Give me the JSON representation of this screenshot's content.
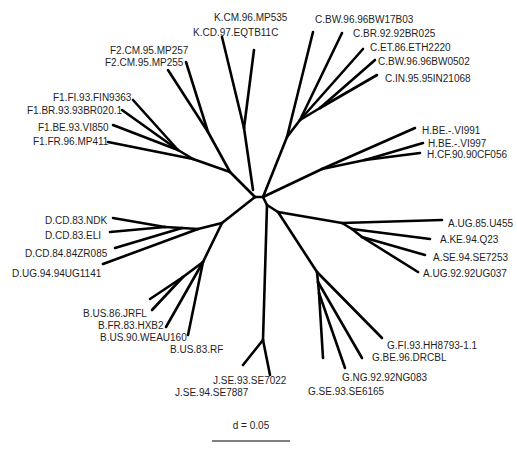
{
  "tree": {
    "type": "unrooted-phylogenetic-tree",
    "line_color": "#000000",
    "subtypes": [
      {
        "name": "K",
        "leaves": [
          {
            "label": "K.CM.96.MP535"
          },
          {
            "label": "K.CD.97.EQTB11C"
          }
        ]
      },
      {
        "name": "C",
        "leaves": [
          {
            "label": "C.BW.96.96BW17B03"
          },
          {
            "label": "C.BR.92.92BR025"
          },
          {
            "label": "C.ET.86.ETH2220"
          },
          {
            "label": "C.BW.96.96BW0502"
          },
          {
            "label": "C.IN.95.95IN21068"
          }
        ]
      },
      {
        "name": "F2",
        "leaves": [
          {
            "label": "F2.CM.95.MP257"
          },
          {
            "label": "F2.CM.95.MP255"
          }
        ]
      },
      {
        "name": "F1",
        "leaves": [
          {
            "label": "F1.FI.93.FIN9363"
          },
          {
            "label": "F1.BR.93.93BR020.1"
          },
          {
            "label": "F1.BE.93.VI850"
          },
          {
            "label": "F1.FR.96.MP411"
          }
        ]
      },
      {
        "name": "H",
        "leaves": [
          {
            "label": "H.BE.-.VI991"
          },
          {
            "label": "H.BE.-.VI997"
          },
          {
            "label": "H.CF.90.90CF056"
          }
        ]
      },
      {
        "name": "A",
        "leaves": [
          {
            "label": "A.UG.85.U455"
          },
          {
            "label": "A.KE.94.Q23"
          },
          {
            "label": "A.SE.94.SE7253"
          },
          {
            "label": "A.UG.92.92UG037"
          }
        ]
      },
      {
        "name": "D",
        "leaves": [
          {
            "label": "D.CD.83.NDK"
          },
          {
            "label": "D.CD.83.ELI"
          },
          {
            "label": "D.CD.84.84ZR085"
          },
          {
            "label": "D.UG.94.94UG1141"
          }
        ]
      },
      {
        "name": "B",
        "leaves": [
          {
            "label": "B.US.86.JRFL"
          },
          {
            "label": "B.FR.83.HXB2"
          },
          {
            "label": "B.US.90.WEAU160"
          },
          {
            "label": "B.US.83.RF"
          }
        ]
      },
      {
        "name": "J",
        "leaves": [
          {
            "label": "J.SE.93.SE7022"
          },
          {
            "label": "J.SE.94.SE7887"
          }
        ]
      },
      {
        "name": "G",
        "leaves": [
          {
            "label": "G.FI.93.HH8793-1.1"
          },
          {
            "label": "G.BE.96.DRCBL"
          },
          {
            "label": "G.NG.92.92NG083"
          },
          {
            "label": "G.SE.93.SE6165"
          }
        ]
      }
    ],
    "branches": [
      [
        255,
        197,
        263,
        197
      ],
      [
        255,
        197,
        230,
        172
      ],
      [
        230,
        172,
        208,
        132
      ],
      [
        208,
        132,
        186,
        62
      ],
      [
        208,
        132,
        168,
        70
      ],
      [
        230,
        172,
        193,
        159
      ],
      [
        193,
        159,
        108,
        142
      ],
      [
        193,
        159,
        178,
        150
      ],
      [
        178,
        150,
        113,
        125
      ],
      [
        178,
        150,
        133,
        100
      ],
      [
        178,
        150,
        122,
        110
      ],
      [
        253,
        190,
        244,
        128
      ],
      [
        244,
        128,
        222,
        37
      ],
      [
        244,
        128,
        254,
        50
      ],
      [
        263,
        197,
        287,
        137
      ],
      [
        287,
        137,
        313,
        32
      ],
      [
        287,
        137,
        300,
        120
      ],
      [
        300,
        120,
        342,
        33
      ],
      [
        300,
        120,
        363,
        49
      ],
      [
        300,
        120,
        320,
        108
      ],
      [
        320,
        108,
        375,
        60
      ],
      [
        320,
        108,
        377,
        75
      ],
      [
        263,
        197,
        322,
        169
      ],
      [
        322,
        169,
        415,
        128
      ],
      [
        322,
        169,
        365,
        160
      ],
      [
        365,
        160,
        423,
        143
      ],
      [
        365,
        160,
        420,
        153
      ],
      [
        263,
        197,
        267,
        205
      ],
      [
        267,
        205,
        263,
        340
      ],
      [
        263,
        340,
        243,
        365
      ],
      [
        263,
        340,
        270,
        375
      ],
      [
        267,
        205,
        278,
        212
      ],
      [
        278,
        212,
        342,
        223
      ],
      [
        342,
        223,
        442,
        220
      ],
      [
        342,
        223,
        352,
        229
      ],
      [
        352,
        229,
        430,
        239
      ],
      [
        352,
        229,
        362,
        237
      ],
      [
        362,
        237,
        425,
        255
      ],
      [
        362,
        237,
        418,
        272
      ],
      [
        278,
        212,
        317,
        272
      ],
      [
        317,
        272,
        382,
        338
      ],
      [
        317,
        272,
        318,
        282
      ],
      [
        318,
        282,
        362,
        358
      ],
      [
        318,
        282,
        319,
        293
      ],
      [
        319,
        293,
        345,
        368
      ],
      [
        319,
        293,
        323,
        358
      ],
      [
        255,
        197,
        222,
        223
      ],
      [
        222,
        223,
        198,
        229
      ],
      [
        198,
        229,
        103,
        264
      ],
      [
        198,
        229,
        182,
        228
      ],
      [
        182,
        228,
        115,
        248
      ],
      [
        182,
        228,
        165,
        227
      ],
      [
        165,
        227,
        113,
        218
      ],
      [
        165,
        227,
        110,
        232
      ],
      [
        222,
        223,
        203,
        262
      ],
      [
        203,
        262,
        188,
        335
      ],
      [
        203,
        262,
        166,
        327
      ],
      [
        203,
        262,
        183,
        277
      ],
      [
        183,
        277,
        150,
        299
      ],
      [
        183,
        277,
        152,
        310
      ]
    ]
  },
  "scale_bar": {
    "label": "d = 0.05",
    "value": 0.05
  }
}
